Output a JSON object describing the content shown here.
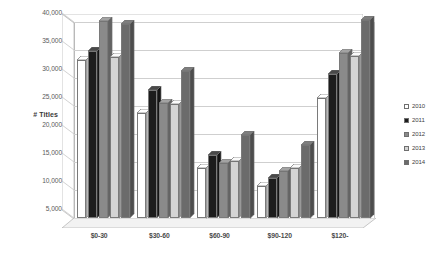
{
  "chart_data": {
    "type": "bar",
    "title": "",
    "subtitle": "",
    "xlabel": "",
    "ylabel": "# Titles",
    "ylim": [
      5000,
      40000
    ],
    "grid": true,
    "legend_position": "right",
    "ytick_labels": [
      "40,000",
      "35,000",
      "30,000",
      "25,000",
      "20,000",
      "15,000",
      "10,000",
      "5,000"
    ],
    "ytick_values": [
      40000,
      35000,
      30000,
      25000,
      20000,
      15000,
      10000,
      5000
    ],
    "categories": [
      "$0-30",
      "$30-60",
      "$60-90",
      "$90-120",
      "$120-"
    ],
    "series": [
      {
        "name": "2010",
        "color": "#ffffff",
        "values": [
          33200,
          23800,
          14000,
          10700,
          26400
        ]
      },
      {
        "name": "2011",
        "color": "#1c1c1c",
        "values": [
          34800,
          27800,
          16200,
          12200,
          30800
        ]
      },
      {
        "name": "2012",
        "color": "#8a8a8a",
        "values": [
          40100,
          25500,
          14800,
          13400,
          34500
        ]
      },
      {
        "name": "2013",
        "color": "#d4d4d4",
        "values": [
          33800,
          25300,
          15100,
          13900,
          34000
        ]
      },
      {
        "name": "2014",
        "color": "#6b6b6b",
        "values": [
          39600,
          31200,
          19900,
          18100,
          40400
        ]
      }
    ]
  },
  "legend": {
    "items": [
      {
        "label": "2010"
      },
      {
        "label": "2011"
      },
      {
        "label": "2012"
      },
      {
        "label": "2013"
      },
      {
        "label": "2014"
      }
    ]
  }
}
